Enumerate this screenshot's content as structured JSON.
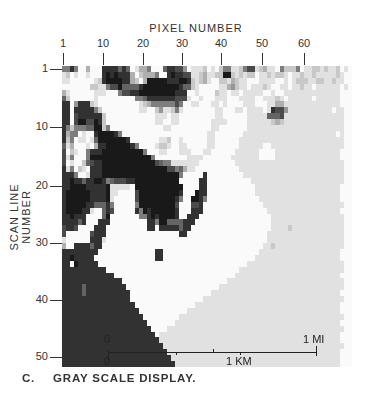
{
  "figure": {
    "x_axis_title": "PIXEL NUMBER",
    "y_axis_title": "SCAN LINE NUMBER",
    "x_ticks": [
      {
        "label": "1",
        "x": 63
      },
      {
        "label": "10",
        "x": 103
      },
      {
        "label": "20",
        "x": 143
      },
      {
        "label": "30",
        "x": 182
      },
      {
        "label": "40",
        "x": 221
      },
      {
        "label": "50",
        "x": 262
      },
      {
        "label": "60",
        "x": 304
      }
    ],
    "y_ticks": [
      {
        "label": "1",
        "y": 69
      },
      {
        "label": "10",
        "y": 127
      },
      {
        "label": "20",
        "y": 186
      },
      {
        "label": "30",
        "y": 243
      },
      {
        "label": "40",
        "y": 300
      },
      {
        "label": "50",
        "y": 357
      }
    ],
    "scale_bar": {
      "mi_zero": "0",
      "mi_label": "1 MI",
      "km_zero": "0",
      "km_label": "1 KM"
    },
    "caption_letter": "C.",
    "caption_text": "GRAY SCALE DISPLAY.",
    "ink_color": "#222222",
    "paper_color": "#ffffff"
  },
  "raster": {
    "cols": 72,
    "rows": 51,
    "legend": "0=white ... 9=black",
    "lines": [
      "558500300088886860133500068877401112010255112577123110522250112212112010",
      "120100100089898883023335008988771123112299212122011212210112112111112100",
      "110000001289999883203999998889982123100221321100011110010122211221121100",
      "000000022115779666689999999998662100000113421101112100110112110111111010",
      "310000001110005778899999999988800100002110110111110010011111111111111000",
      "620000001000000000556888888877710010001110001111001112101111110111111000",
      "880488821000000000012355555575001100011010000111000113311111111111111000",
      "880888885200000000011002411251000000001100011011110187741111111111101100",
      "880788888820000000000001110110000000001100000011111666711111111111111100",
      "880799779820000000000001100110000000011110000011111123211111111111111100",
      "852555669925000000000000011000000000011000000011111111111111111111111100",
      "835501008999985000000000000000000000110000000111111111111111111111110100",
      "825011016999999980000000112001000000110000001111111111111111111111111100",
      "613000103889999998500001221001100000110000001111110011111111111111111100",
      "702100588899999999995000110001110001100000011111100001111111111111111000",
      "715000599999999999999950000000011110000000111111100001111111111111111000",
      "701002678899999999999997655111111100000000011111111111111111111111111100",
      "815021088899999999999999997756311000000000001111111111111111111111111100",
      "888500188899999999999999999995000008000000000111111111111111111111111100",
      "889886889985677788999999999990000088000000000001111111111111111111111100",
      "889999888889111110999999999999000088000000000000111111111111111111111000",
      "899999988889110000799999999998000988000000000000111111111111111111111000",
      "899999988889100000799999999985009985000000000000011111111111111111111000",
      "899999886668500000599999999970007780000000000000001111111111111111111100",
      "899998810068700000859899999980008880000000000000000111111111111111111000",
      "889888000069000000055898999980088800000000000000000011111111111111111100",
      "888868000888000000000885996666888000000000000000000011111111111111111100",
      "788700008880000000000880888886880000000000000000000011112111111111111100",
      "700000078880000000000000000008800000000000000000000111111111111111111100",
      "100000088810000000000000000000000000000000000000000111111111111111111100",
      "300888868800000000000000000000000000000000000000001121111111111111111100",
      "888888888000000000000008800000000000000000000000011111111111111111111000",
      "889888880000000000000008800000000000000000000000111111111111111111111000",
      "880988888000000000000000000000000000000000000011111111111111111111111100",
      "888888888880000000000000000000000000000000001111111111111111111111111100",
      "888888888888800000000000000000000000000000011111111111111111111111111000",
      "888888888888888000000000000000000000000001111111111111111111111111111100",
      "888886888888888800000000000000000000000111111111111111111111111111111100",
      "888886888888888880000000000000000000011111111111111111111111111111111000",
      "888888888888888880000000000000000001111111111111111111111111111111111100",
      "888888888888888888000000000000000111111111111111111111111111111111111000",
      "888888888888888888800000000000011111111111111111111111111111111111111000",
      "888888888888888888880000000001111111111111111111111111111111111111111100",
      "888888888888888888888000000011111111111111111111111111111111111111111000",
      "888888888888888888888800001111111111111111111111111111111111111111111100",
      "888888888888888888888880111111111111111111111111111111111111111111111000",
      "888888888888888888888888111111111111111111111111111111111111111111111000",
      "888888888888888888888888811111111111111111111111111111111111111111111100",
      "888888888888888888888888881111111111111111111111111111111111111111111000",
      "888888888888888888888888888111111111111111111111111111111111111111111000",
      "888888888888888888888888888811111111111111111111111111111111111111111000"
    ]
  }
}
